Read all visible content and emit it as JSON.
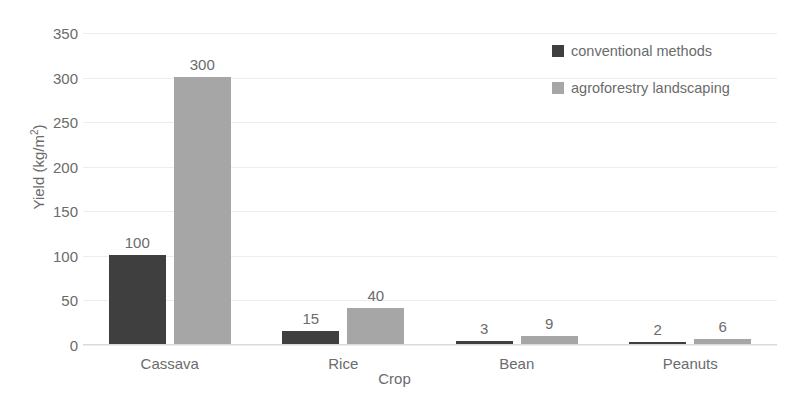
{
  "chart_data": {
    "type": "bar",
    "title": "",
    "subtitle": "",
    "xlabel": "Crop",
    "ylabel": "Yield (kg/m2)",
    "ylabel_base": "Yield (kg/m",
    "ylabel_sup": "2",
    "ylabel_close": ")",
    "categories": [
      "Cassava",
      "Rice",
      "Bean",
      "Peanuts"
    ],
    "series": [
      {
        "name": "conventional methods",
        "color": "#3f3f3f",
        "values": [
          100,
          15,
          3,
          2
        ],
        "labels": [
          "100",
          "15",
          "3",
          "2"
        ]
      },
      {
        "name": "agroforestry landscaping",
        "color": "#a6a6a6",
        "values": [
          300,
          40,
          9,
          6
        ],
        "labels": [
          "300",
          "40",
          "9",
          "6"
        ]
      }
    ],
    "ylim": [
      0,
      350
    ],
    "ytick_step": 50,
    "yticks": [
      0,
      50,
      100,
      150,
      200,
      250,
      300,
      350
    ],
    "ytick_labels": [
      "0",
      "50",
      "100",
      "150",
      "200",
      "250",
      "300",
      "350"
    ],
    "grid": true,
    "grid_color": "#ededed",
    "legend_position": "top-right",
    "background": "#ffffff",
    "text_color": "#6b6b6b"
  }
}
